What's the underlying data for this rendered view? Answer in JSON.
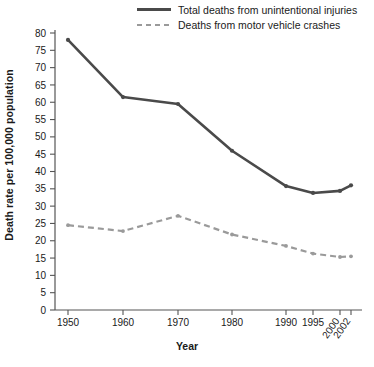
{
  "chart_data": {
    "type": "line",
    "title": "",
    "xlabel": "Year",
    "ylabel": "Death rate per 100,000 population",
    "x": [
      1950,
      1960,
      1970,
      1980,
      1990,
      1995,
      2000,
      2002
    ],
    "xtick_labels": [
      "1950",
      "1960",
      "1970",
      "1980",
      "1990",
      "1995",
      "2000",
      "2002"
    ],
    "xtick_rotated": [
      "2000",
      "2002"
    ],
    "ylim": [
      0,
      80
    ],
    "ytick_labels": [
      "0",
      "5",
      "10",
      "15",
      "20",
      "25",
      "30",
      "35",
      "40",
      "45",
      "50",
      "55",
      "60",
      "65",
      "70",
      "75",
      "80"
    ],
    "ytick_values": [
      0,
      5,
      10,
      15,
      20,
      25,
      30,
      35,
      40,
      45,
      50,
      55,
      60,
      65,
      70,
      75,
      80
    ],
    "grid": false,
    "legend_position": "top-right",
    "series": [
      {
        "name": "Total deaths from unintentional injuries",
        "style": "solid",
        "color": "#4a4a4a",
        "values": [
          78.0,
          61.5,
          59.5,
          46.0,
          35.8,
          33.8,
          34.4,
          36.0
        ]
      },
      {
        "name": "Deaths from motor vehicle crashes",
        "style": "dashed",
        "color": "#9a9a9a",
        "values": [
          24.5,
          22.8,
          27.2,
          21.8,
          18.5,
          16.3,
          15.3,
          15.5
        ]
      }
    ]
  },
  "legend": {
    "items": [
      {
        "label": "Total deaths from unintentional injuries",
        "style": "solid"
      },
      {
        "label": "Deaths from motor vehicle crashes",
        "style": "dashed"
      }
    ]
  },
  "axes": {
    "x_title": "Year",
    "y_title": "Death rate per 100,000 population"
  }
}
